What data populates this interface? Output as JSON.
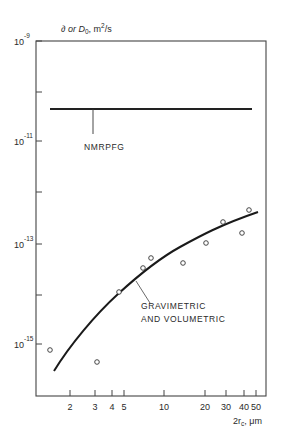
{
  "chart_data": {
    "type": "line",
    "title": "",
    "ylabel": "D or D0, m2/s",
    "ylabel_parts": {
      "main": "∂ or D",
      "sub": "0",
      "rest": ", m",
      "sup": "2",
      "tail": "/s"
    },
    "xlabel": "2rc, μm",
    "xlabel_parts": {
      "main": "2r",
      "sub": "c",
      "rest": ", μm"
    },
    "xscale": "log",
    "yscale": "log",
    "xlim": [
      1.2,
      55
    ],
    "ylim": [
      1e-16,
      1e-09
    ],
    "grid": false,
    "legend": "none (inline annotations)",
    "x_ticks": [
      {
        "value": 2,
        "label": "2",
        "px": 70
      },
      {
        "value": 3,
        "label": "3",
        "px": 95
      },
      {
        "value": 4,
        "label": "4",
        "px": 112
      },
      {
        "value": 5,
        "label": "5",
        "px": 124
      },
      {
        "value": 10,
        "label": "10",
        "px": 164
      },
      {
        "value": 20,
        "label": "20",
        "px": 205
      },
      {
        "value": 30,
        "label": "30",
        "px": 226
      },
      {
        "value": 40,
        "label": "40",
        "px": 244
      },
      {
        "value": 50,
        "label": "50",
        "px": 256
      }
    ],
    "y_ticks": [
      {
        "value": 1e-09,
        "base": "10",
        "exp": "-9",
        "labeled": true,
        "px": 41
      },
      {
        "value": 1e-10,
        "labeled": false,
        "px": 92
      },
      {
        "value": 1e-11,
        "base": "10",
        "exp": "-11",
        "labeled": true,
        "px": 141
      },
      {
        "value": 1e-12,
        "labeled": false,
        "px": 192
      },
      {
        "value": 1e-13,
        "base": "10",
        "exp": "-13",
        "labeled": true,
        "px": 244
      },
      {
        "value": 1e-14,
        "labeled": false,
        "px": 295
      },
      {
        "value": 1e-15,
        "base": "10",
        "exp": "-15",
        "labeled": true,
        "px": 344
      }
    ],
    "series": [
      {
        "name": "NMRPFG",
        "style": "line",
        "x": [
          1.4,
          48
        ],
        "y": [
          5e-11,
          5e-11
        ]
      },
      {
        "name": "GRAVIMETRIC AND VOLUMETRIC",
        "style": "curve",
        "x": [
          1.6,
          2,
          3,
          4,
          5,
          7,
          10,
          15,
          20,
          30,
          40,
          50
        ],
        "y": [
          2.5e-16,
          1.2e-15,
          5e-15,
          1.2e-14,
          2e-14,
          4e-14,
          7e-14,
          1.3e-13,
          1.9e-13,
          2.8e-13,
          3.6e-13,
          4.3e-13
        ]
      },
      {
        "name": "Experimental points",
        "style": "open-circle markers",
        "x": [
          1.5,
          3.2,
          4.6,
          7.0,
          7.8,
          13.5,
          21,
          28,
          38,
          45
        ],
        "y": [
          7e-16,
          4e-16,
          1.1e-14,
          3.4e-14,
          5.5e-14,
          4.4e-14,
          1e-13,
          2.6e-13,
          1.6e-13,
          4.6e-13
        ]
      }
    ],
    "annotations": [
      {
        "text": "NMRPFG",
        "target": "NMRPFG line"
      },
      {
        "text": "GRAVIMETRIC",
        "target": "curve"
      },
      {
        "text": "AND VOLUMETRIC",
        "target": "curve"
      }
    ]
  },
  "plot": {
    "box": {
      "left": 36,
      "top": 41,
      "right": 266,
      "bottom": 396
    },
    "nmr_line": {
      "x1": 50,
      "x2": 252,
      "y": 109
    },
    "nmr_leader": {
      "x": 93,
      "y1": 109,
      "y2": 134
    },
    "points_px": [
      [
        50,
        350
      ],
      [
        97,
        362
      ],
      [
        119,
        292
      ],
      [
        143,
        268
      ],
      [
        151,
        258
      ],
      [
        183,
        263
      ],
      [
        206,
        243
      ],
      [
        223,
        222
      ],
      [
        242,
        233
      ],
      [
        249,
        210
      ]
    ],
    "curve_path": "M 54 371 C 70 345, 95 315, 118 294 S 160 258, 180 247 S 220 225, 258 212",
    "grav_leader": {
      "x1": 136,
      "y1": 281,
      "x2": 150,
      "y2": 303
    },
    "labels": {
      "nmr": "NMRPFG",
      "grav1": "GRAVIMETRIC",
      "grav2": "AND VOLUMETRIC"
    }
  },
  "colors": {
    "ink": "#2a2a2a",
    "axis": "#444444",
    "background": "#ffffff"
  }
}
